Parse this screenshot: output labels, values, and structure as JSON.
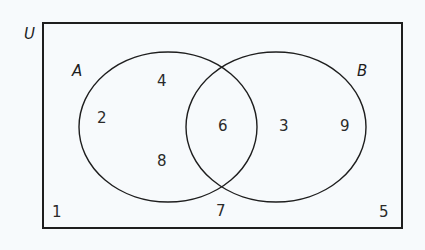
{
  "diagram": {
    "type": "venn",
    "universe_label": "U",
    "sets": [
      {
        "name": "A",
        "label": "A"
      },
      {
        "name": "B",
        "label": "B"
      }
    ],
    "regions": {
      "a_only": [
        "4",
        "2",
        "8"
      ],
      "a_and_b": [
        "6"
      ],
      "b_only": [
        "3",
        "9"
      ],
      "neither": [
        "1",
        "7",
        "5"
      ]
    },
    "colors": {
      "line": "#1e1e1e",
      "background": "#f7fafc"
    }
  }
}
